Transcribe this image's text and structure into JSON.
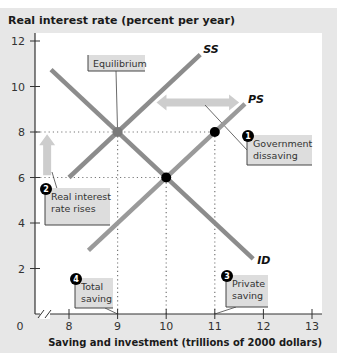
{
  "chart_data": {
    "type": "line",
    "title": "",
    "ylabel": "Real interest rate (percent per year)",
    "xlabel": "Saving and investment (trillions of 2000 dollars)",
    "xlim": [
      8,
      13
    ],
    "ylim": [
      0,
      12
    ],
    "x_origin_label": "0",
    "x_axis_break": true,
    "xticks": [
      8,
      9,
      10,
      11,
      12,
      13
    ],
    "yticks": [
      2,
      4,
      6,
      8,
      10,
      12
    ],
    "grid": false,
    "series": [
      {
        "name": "SS",
        "label": "SS",
        "color": "#8c8c8c",
        "points": [
          [
            8.0,
            6.0
          ],
          [
            10.7,
            11.4
          ]
        ]
      },
      {
        "name": "PS",
        "label": "PS",
        "color": "#9a9a9a",
        "points": [
          [
            8.4,
            2.8
          ],
          [
            11.62,
            9.24
          ]
        ]
      },
      {
        "name": "ID",
        "label": "ID",
        "color": "#8c8c8c",
        "points": [
          [
            7.63,
            10.74
          ],
          [
            11.79,
            2.42
          ]
        ]
      }
    ],
    "markers": [
      {
        "name": "equilibrium-point",
        "x": 9,
        "y": 8,
        "color": "#7a7a7a"
      },
      {
        "name": "private-saving-point",
        "x": 11,
        "y": 8,
        "color": "#000000"
      },
      {
        "name": "initial-equilibrium-point",
        "x": 10,
        "y": 6,
        "color": "#000000"
      }
    ],
    "reference_lines": [
      {
        "from": [
          8,
          8
        ],
        "to": [
          11,
          8
        ]
      },
      {
        "from": [
          8,
          6
        ],
        "to": [
          10,
          6
        ]
      },
      {
        "from": [
          9,
          0
        ],
        "to": [
          9,
          8
        ]
      },
      {
        "from": [
          10,
          0
        ],
        "to": [
          10,
          6
        ]
      },
      {
        "from": [
          11,
          0
        ],
        "to": [
          11,
          8
        ]
      }
    ],
    "arrows": [
      {
        "name": "government-dissaving-arrow",
        "type": "double-horizontal",
        "from": [
          9.8,
          9.3
        ],
        "to": [
          11.5,
          9.3
        ]
      },
      {
        "name": "interest-rate-up-arrow",
        "type": "up",
        "from": [
          7.55,
          6.1
        ],
        "to": [
          7.55,
          7.9
        ]
      }
    ],
    "annotations": [
      {
        "name": "equilibrium",
        "number": "",
        "lines": [
          "Equilibrium"
        ]
      },
      {
        "name": "government-dissaving",
        "number": "1",
        "lines": [
          "Government",
          "dissaving"
        ]
      },
      {
        "name": "real-interest-rate-rises",
        "number": "2",
        "lines": [
          "Real interest",
          "rate rises"
        ]
      },
      {
        "name": "private-saving",
        "number": "3",
        "lines": [
          "Private",
          "saving"
        ]
      },
      {
        "name": "total-saving",
        "number": "4",
        "lines": [
          "Total",
          "saving"
        ]
      }
    ]
  }
}
